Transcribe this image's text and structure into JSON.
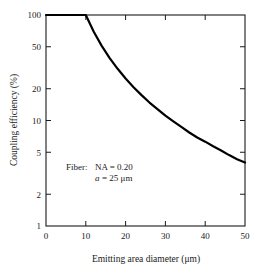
{
  "chart_data": {
    "type": "line",
    "title": "",
    "xlabel": "Emitting area diameter (μm)",
    "ylabel": "Coupling efficiency (%)",
    "xlim": [
      0,
      50
    ],
    "ylim": [
      1,
      100
    ],
    "yscale": "log",
    "xscale": "linear",
    "grid": false,
    "legend": null,
    "xticks": [
      "0",
      "10",
      "20",
      "30",
      "40",
      "50"
    ],
    "xtick_values": [
      0,
      10,
      20,
      30,
      40,
      50
    ],
    "yticks": [
      "1",
      "2",
      "5",
      "10",
      "20",
      "50",
      "100"
    ],
    "ytick_values": [
      1,
      2,
      5,
      10,
      20,
      50,
      100
    ],
    "series": [
      {
        "name": "Coupling efficiency",
        "color": "#000000",
        "x": [
          0,
          2,
          4,
          6,
          8,
          10,
          12,
          14,
          16,
          18,
          20,
          22,
          24,
          26,
          28,
          30,
          32,
          34,
          36,
          38,
          40,
          42,
          44,
          46,
          48,
          50
        ],
        "values": [
          100,
          100,
          100,
          100,
          100,
          100,
          69.4,
          51.0,
          39.1,
          30.9,
          25.0,
          20.7,
          17.4,
          14.8,
          12.8,
          11.1,
          9.8,
          8.7,
          7.7,
          6.9,
          6.3,
          5.7,
          5.2,
          4.7,
          4.3,
          4.0
        ]
      }
    ],
    "annotations": [
      {
        "text": "Fiber:  NA = 0.20",
        "x": 17,
        "y": 6.5
      },
      {
        "text": "a = 25 μm",
        "x": 24.5,
        "y": 5.3,
        "italic_prefix": "a"
      }
    ]
  },
  "annotation": {
    "line1_label": "Fiber:",
    "line1_value": "NA = 0.20",
    "line2_symbol": "a",
    "line2_value": "= 25 μm"
  },
  "axes": {
    "x_title": "Emitting area diameter (μm)",
    "y_title": "Coupling efficiency (%)"
  },
  "colors": {
    "curve": "#000000",
    "frame": "#1a1a1a",
    "background": "#ffffff"
  }
}
